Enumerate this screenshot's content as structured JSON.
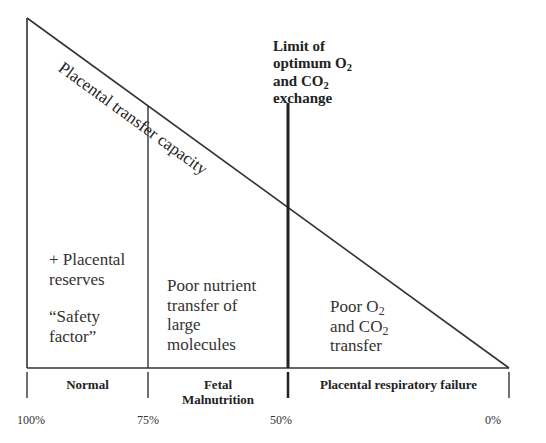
{
  "diagram": {
    "diagonal_label": "Placental transfer capacity",
    "limit_label": {
      "line1": "Limit of",
      "line2_prefix": "optimum O",
      "line2_sub": "2",
      "line3_prefix": "and CO",
      "line3_sub": "2",
      "line4": "exchange"
    },
    "regions": [
      {
        "lines": [
          "+ Placental",
          "reserves"
        ],
        "quote_lines": [
          "“Safety",
          "factor”"
        ]
      },
      {
        "lines": [
          "Poor nutrient",
          "transfer of",
          "large",
          "molecules"
        ]
      },
      {
        "line1_prefix": "Poor  O",
        "line1_sub": "2",
        "line2_prefix": "and CO",
        "line2_sub": "2",
        "line3": "transfer"
      }
    ],
    "bands": [
      {
        "label_line1": "Normal"
      },
      {
        "label_line1": "Fetal",
        "label_line2": "Malnutrition"
      },
      {
        "label_line1": "Placental respiratory failure"
      }
    ],
    "axis_ticks": [
      "100%",
      "75%",
      "50%",
      "0%"
    ]
  }
}
